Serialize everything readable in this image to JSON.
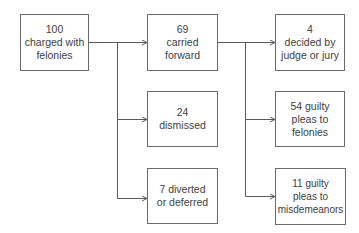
{
  "diagram": {
    "type": "flowchart",
    "colors": {
      "background": "#ffffff",
      "line": "#5a5a5a",
      "border": "#6a6a6a",
      "text": "#3e3e3e"
    },
    "nodes": {
      "charged": {
        "lines": [
          "100",
          "charged with",
          "felonies"
        ]
      },
      "carried": {
        "lines": [
          "69",
          "carried",
          "forward"
        ]
      },
      "dismissed": {
        "lines": [
          "24",
          "dismissed"
        ]
      },
      "diverted": {
        "lines": [
          "7 diverted",
          "or deferred"
        ]
      },
      "decided": {
        "lines": [
          "4",
          "decided by",
          "judge or jury"
        ]
      },
      "guilty_felonies": {
        "lines": [
          "54 guilty",
          "pleas to",
          "felonies"
        ]
      },
      "guilty_misdemeanors": {
        "lines": [
          "11 guilty",
          "pleas to",
          "misdemeanors"
        ]
      }
    },
    "edges": [
      {
        "from": "charged",
        "to": "carried"
      },
      {
        "from": "charged",
        "to": "dismissed"
      },
      {
        "from": "charged",
        "to": "diverted"
      },
      {
        "from": "carried",
        "to": "decided"
      },
      {
        "from": "carried",
        "to": "guilty_felonies"
      },
      {
        "from": "carried",
        "to": "guilty_misdemeanors"
      }
    ]
  }
}
